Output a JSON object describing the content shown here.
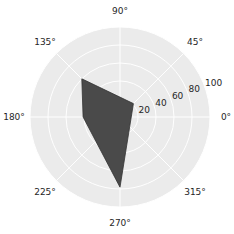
{
  "chart_data": {
    "type": "polar-area",
    "title": "",
    "angular_ticks": [
      "0°",
      "45°",
      "90°",
      "135°",
      "180°",
      "225°",
      "270°",
      "315°"
    ],
    "radial_ticks": [
      "20",
      "40",
      "60",
      "80",
      "100"
    ],
    "rlim": [
      0,
      100
    ],
    "grid": true,
    "theta_deg": [
      45,
      135,
      180,
      270
    ],
    "r": [
      21,
      60,
      41,
      78
    ],
    "fill_color": "#4a4a4a",
    "background_color": "#ebebeb",
    "grid_color": "#ffffff"
  }
}
